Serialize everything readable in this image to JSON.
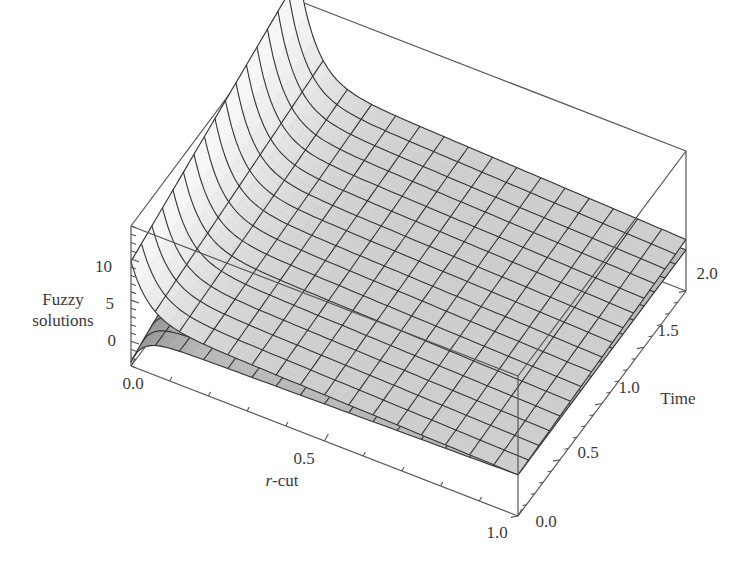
{
  "chart_data": {
    "type": "surface3d",
    "title": "",
    "xlabel": "r-cut",
    "xlabel_italic_prefix": "r",
    "xlabel_suffix": "-cut",
    "ylabel": "Time",
    "zlabel_lines": [
      "Fuzzy",
      "solutions"
    ],
    "x_range": [
      0.0,
      1.0
    ],
    "y_range": [
      0.0,
      2.0
    ],
    "z_range": [
      -3,
      14
    ],
    "x_ticks": [
      "0.0",
      "0.5",
      "1.0"
    ],
    "y_ticks": [
      "0.0",
      "0.5",
      "1.0",
      "1.5",
      "2.0"
    ],
    "z_ticks": [
      "0",
      "5",
      "10"
    ],
    "mesh": {
      "r_lines": 16,
      "t_lines": 16
    },
    "series": [
      {
        "name": "upper fuzzy solution",
        "shade": "light",
        "description": "Large at r=0 near t=0, drops quickly along r then flattens; slopes slightly downward toward larger time",
        "samples": [
          {
            "r": 0.0,
            "t": 0.0,
            "z": 8.5
          },
          {
            "r": 0.0,
            "t": 2.0,
            "z": 14.0
          },
          {
            "r": 0.1,
            "t": 0.0,
            "z": 4.5
          },
          {
            "r": 0.5,
            "t": 0.0,
            "z": 2.8
          },
          {
            "r": 1.0,
            "t": 0.0,
            "z": 2.0
          },
          {
            "r": 1.0,
            "t": 2.0,
            "z": 3.5
          }
        ]
      },
      {
        "name": "lower fuzzy solution",
        "shade": "dark",
        "description": "Near -1 at r=0, rises quickly then flattens, meets upper surface at r=1",
        "samples": [
          {
            "r": 0.0,
            "t": 0.0,
            "z": -2.5
          },
          {
            "r": 0.1,
            "t": 0.0,
            "z": 0.5
          },
          {
            "r": 0.5,
            "t": 0.0,
            "z": 1.3
          },
          {
            "r": 1.0,
            "t": 0.0,
            "z": 2.0
          }
        ]
      }
    ],
    "grid": false,
    "legend": "none",
    "box": true
  }
}
